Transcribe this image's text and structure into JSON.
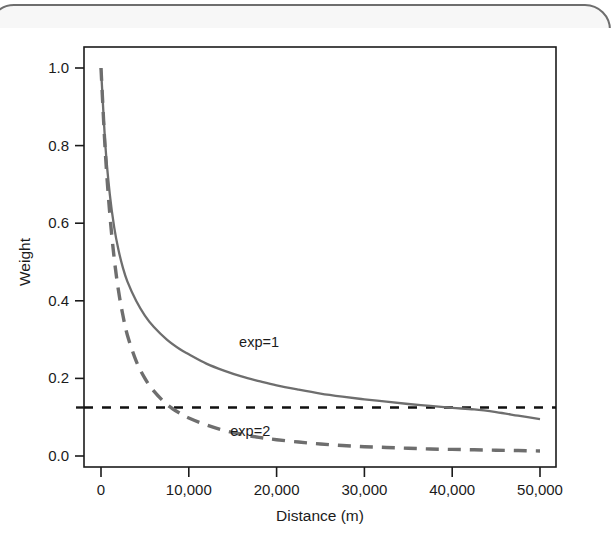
{
  "figure": {
    "name": "distance-decay-weight-figure",
    "background": "#ffffff",
    "page_edge_color": "#6e6e6e"
  },
  "chart_data": {
    "type": "line",
    "title": "",
    "xlabel": "Distance (m)",
    "ylabel": "Weight",
    "xlim": [
      0,
      50000
    ],
    "ylim": [
      0.0,
      1.0
    ],
    "grid": false,
    "legend_position": "inline-annotations",
    "x_ticks": [
      0,
      10000,
      20000,
      30000,
      40000,
      50000
    ],
    "x_tick_labels": [
      "0",
      "10,000",
      "20,000",
      "30,000",
      "40,000",
      "50,000"
    ],
    "y_ticks": [
      0.0,
      0.2,
      0.4,
      0.6,
      0.8,
      1.0
    ],
    "y_tick_labels": [
      "0.0",
      "0.2",
      "0.4",
      "0.6",
      "0.8",
      "1.0"
    ],
    "series": [
      {
        "name": "exp=1",
        "label": "exp=1",
        "style": "solid",
        "color": "#6e6e6e",
        "annotation_x": 18000,
        "annotation_y": 0.295,
        "x": [
          0,
          500,
          1000,
          1500,
          2000,
          2500,
          3000,
          4000,
          5000,
          6000,
          7500,
          9000,
          10000,
          12000,
          14000,
          16000,
          18000,
          20000,
          22500,
          25000,
          27500,
          30000,
          32500,
          35000,
          37500,
          40000,
          42500,
          45000,
          47500,
          50000
        ],
        "y": [
          1.0,
          0.8,
          0.675,
          0.59,
          0.53,
          0.485,
          0.45,
          0.4,
          0.362,
          0.333,
          0.3,
          0.275,
          0.262,
          0.238,
          0.22,
          0.205,
          0.193,
          0.182,
          0.171,
          0.161,
          0.153,
          0.146,
          0.14,
          0.134,
          0.129,
          0.124,
          0.12,
          0.113,
          0.104,
          0.095
        ]
      },
      {
        "name": "exp=2",
        "label": "exp=2",
        "style": "dashed",
        "color": "#6e6e6e",
        "annotation_x": 17000,
        "annotation_y": 0.065,
        "x": [
          0,
          500,
          1000,
          1500,
          2000,
          2500,
          3000,
          4000,
          5000,
          6000,
          7500,
          9000,
          10000,
          12000,
          14000,
          16000,
          18000,
          20000,
          22500,
          25000,
          27500,
          30000,
          32500,
          35000,
          37500,
          40000,
          42500,
          45000,
          47500,
          50000
        ],
        "y": [
          1.0,
          0.78,
          0.625,
          0.51,
          0.425,
          0.362,
          0.312,
          0.245,
          0.2,
          0.168,
          0.133,
          0.11,
          0.098,
          0.08,
          0.066,
          0.056,
          0.048,
          0.042,
          0.036,
          0.031,
          0.027,
          0.024,
          0.022,
          0.02,
          0.018,
          0.017,
          0.016,
          0.015,
          0.014,
          0.013
        ]
      }
    ],
    "reference_line": {
      "name": "threshold-line",
      "value": 0.125,
      "style": "dashed",
      "color": "#111111",
      "orientation": "horizontal"
    }
  }
}
